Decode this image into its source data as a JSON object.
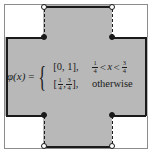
{
  "figure": {
    "colors": {
      "region_fill": "#b8b8b8",
      "outline": "#1a1a1a",
      "frame": "#8c8c8c",
      "background": "#ffffff"
    }
  },
  "equation": {
    "lhs": "φ(x)",
    "equals": "=",
    "open_brace": "{",
    "cases": [
      {
        "value_literal": "[0, 1],",
        "value_plain": "[0, 1]",
        "condition": {
          "left_frac": {
            "num": "1",
            "den": "4"
          },
          "left_op": "<",
          "variable": "x",
          "right_op": "<",
          "right_frac": {
            "num": "3",
            "den": "4"
          }
        },
        "condition_plain": "1/4 < x < 3/4"
      },
      {
        "value_open_bracket": "[",
        "value_frac_left": {
          "num": "1",
          "den": "4"
        },
        "value_comma": ",",
        "value_frac_right": {
          "num": "3",
          "den": "4"
        },
        "value_close_bracket": "],",
        "value_plain": "[1/4, 3/4]",
        "condition_plain": "otherwise",
        "condition_word": "otherwise"
      }
    ]
  },
  "markers": {
    "open_circles": [
      {
        "name": "top-left-open",
        "x_label": "1/4",
        "y_label": "1"
      },
      {
        "name": "top-right-open",
        "x_label": "3/4",
        "y_label": "1"
      },
      {
        "name": "bottom-left-open",
        "x_label": "1/4",
        "y_label": "0"
      },
      {
        "name": "bottom-right-open",
        "x_label": "3/4",
        "y_label": "0"
      }
    ],
    "filled_circles": [
      {
        "name": "top-left-filled",
        "x_label": "1/4",
        "y_label": "3/4"
      },
      {
        "name": "top-right-filled",
        "x_label": "3/4",
        "y_label": "3/4"
      },
      {
        "name": "bottom-left-filled",
        "x_label": "1/4",
        "y_label": "1/4"
      },
      {
        "name": "bottom-right-filled",
        "x_label": "3/4",
        "y_label": "1/4"
      }
    ]
  }
}
